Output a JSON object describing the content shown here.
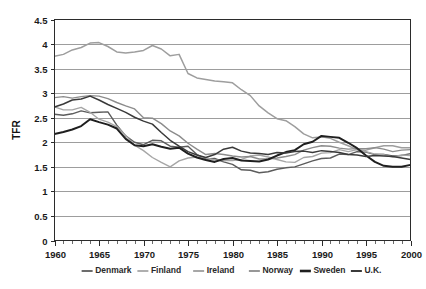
{
  "chart_data": {
    "type": "line",
    "title": "",
    "xlabel": "",
    "ylabel": "TFR",
    "xlim": [
      1960,
      2000
    ],
    "ylim": [
      0,
      4.5
    ],
    "grid": true,
    "legend_position": "bottom",
    "x_ticks": [
      "1960",
      "1965",
      "1970",
      "1975",
      "1980",
      "1985",
      "1990",
      "1995",
      "2000"
    ],
    "x_tick_values": [
      1960,
      1965,
      1970,
      1975,
      1980,
      1985,
      1990,
      1995,
      2000
    ],
    "y_ticks": [
      "0",
      "0.5",
      "1",
      "1.5",
      "2",
      "2.5",
      "3",
      "3.5",
      "4",
      "4.5"
    ],
    "y_tick_values": [
      0,
      0.5,
      1,
      1.5,
      2,
      2.5,
      3,
      3.5,
      4,
      4.5
    ],
    "x": [
      1960,
      1961,
      1962,
      1963,
      1964,
      1965,
      1966,
      1967,
      1968,
      1969,
      1970,
      1971,
      1972,
      1973,
      1974,
      1975,
      1976,
      1977,
      1978,
      1979,
      1980,
      1981,
      1982,
      1983,
      1984,
      1985,
      1986,
      1987,
      1988,
      1989,
      1990,
      1991,
      1992,
      1993,
      1994,
      1995,
      1996,
      1997,
      1998,
      1999,
      2000
    ],
    "series": [
      {
        "name": "Denmark",
        "color": "#5c5c5c",
        "width": 1.4,
        "values": [
          2.57,
          2.55,
          2.58,
          2.64,
          2.6,
          2.61,
          2.62,
          2.35,
          2.13,
          2.0,
          1.95,
          2.04,
          2.03,
          1.92,
          1.9,
          1.92,
          1.75,
          1.66,
          1.67,
          1.6,
          1.55,
          1.44,
          1.43,
          1.38,
          1.4,
          1.45,
          1.48,
          1.5,
          1.56,
          1.62,
          1.67,
          1.68,
          1.76,
          1.75,
          1.81,
          1.8,
          1.75,
          1.75,
          1.72,
          1.73,
          1.77
        ]
      },
      {
        "name": "Finland",
        "color": "#a6a6a6",
        "width": 1.4,
        "values": [
          2.72,
          2.66,
          2.66,
          2.71,
          2.61,
          2.47,
          2.41,
          2.32,
          2.14,
          1.94,
          1.83,
          1.69,
          1.59,
          1.5,
          1.62,
          1.68,
          1.7,
          1.68,
          1.64,
          1.63,
          1.63,
          1.65,
          1.72,
          1.74,
          1.7,
          1.65,
          1.6,
          1.59,
          1.69,
          1.71,
          1.78,
          1.79,
          1.85,
          1.81,
          1.85,
          1.81,
          1.76,
          1.75,
          1.7,
          1.74,
          1.73
        ]
      },
      {
        "name": "Ireland",
        "color": "#9e9e9e",
        "width": 1.5,
        "values": [
          3.75,
          3.79,
          3.88,
          3.93,
          4.02,
          4.03,
          3.95,
          3.84,
          3.82,
          3.84,
          3.87,
          3.97,
          3.9,
          3.76,
          3.79,
          3.4,
          3.31,
          3.28,
          3.25,
          3.23,
          3.21,
          3.07,
          2.95,
          2.74,
          2.6,
          2.48,
          2.44,
          2.32,
          2.17,
          2.09,
          2.11,
          2.08,
          2.0,
          1.93,
          1.85,
          1.84,
          1.89,
          1.93,
          1.93,
          1.89,
          1.89
        ]
      },
      {
        "name": "Norway",
        "color": "#8c8c8c",
        "width": 1.4,
        "values": [
          2.91,
          2.93,
          2.9,
          2.93,
          2.95,
          2.94,
          2.89,
          2.81,
          2.74,
          2.68,
          2.5,
          2.49,
          2.38,
          2.23,
          2.13,
          1.98,
          1.86,
          1.75,
          1.77,
          1.75,
          1.72,
          1.7,
          1.71,
          1.66,
          1.66,
          1.68,
          1.71,
          1.75,
          1.84,
          1.89,
          1.93,
          1.92,
          1.88,
          1.86,
          1.87,
          1.87,
          1.89,
          1.86,
          1.81,
          1.84,
          1.85
        ]
      },
      {
        "name": "Sweden",
        "color": "#1f1f1f",
        "width": 2.0,
        "values": [
          2.17,
          2.21,
          2.26,
          2.33,
          2.47,
          2.41,
          2.36,
          2.28,
          2.07,
          1.94,
          1.92,
          1.96,
          1.91,
          1.87,
          1.89,
          1.77,
          1.69,
          1.64,
          1.6,
          1.66,
          1.68,
          1.63,
          1.62,
          1.61,
          1.65,
          1.73,
          1.8,
          1.84,
          1.96,
          2.01,
          2.13,
          2.11,
          2.09,
          1.99,
          1.88,
          1.73,
          1.6,
          1.52,
          1.5,
          1.5,
          1.54
        ]
      },
      {
        "name": "U.K.",
        "color": "#3a3a3a",
        "width": 1.5,
        "values": [
          2.72,
          2.78,
          2.86,
          2.88,
          2.94,
          2.86,
          2.77,
          2.69,
          2.61,
          2.51,
          2.43,
          2.37,
          2.2,
          2.04,
          1.92,
          1.81,
          1.74,
          1.69,
          1.75,
          1.86,
          1.9,
          1.82,
          1.78,
          1.77,
          1.75,
          1.79,
          1.78,
          1.81,
          1.82,
          1.79,
          1.83,
          1.81,
          1.79,
          1.75,
          1.74,
          1.71,
          1.73,
          1.72,
          1.71,
          1.68,
          1.65
        ]
      }
    ],
    "legend": [
      {
        "label": "Denmark",
        "color": "#5c5c5c",
        "width": 1.8
      },
      {
        "label": "Finland",
        "color": "#a6a6a6",
        "width": 1.8
      },
      {
        "label": "Ireland",
        "color": "#9e9e9e",
        "width": 1.8
      },
      {
        "label": "Norway",
        "color": "#8c8c8c",
        "width": 1.8
      },
      {
        "label": "Sweden",
        "color": "#1f1f1f",
        "width": 2.6
      },
      {
        "label": "U.K.",
        "color": "#3a3a3a",
        "width": 2.0
      }
    ]
  },
  "colors": {
    "background": "#ffffff",
    "gridline": "#9d9d9d",
    "frame": "#2b2b2b",
    "text": "#1a1a1a"
  }
}
